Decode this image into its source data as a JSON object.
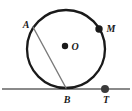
{
  "figure": {
    "type": "geometry-diagram",
    "width": 132,
    "height": 111,
    "background_color": "#ffffff",
    "colors": {
      "circle_stroke": "#1a1a1a",
      "chord_stroke": "#7a7a7a",
      "tangent_stroke": "#8a8a8a",
      "dot_fill": "#1a1a1a",
      "label_color": "#1a1a1a"
    },
    "circle": {
      "center_x": 66,
      "center_y": 49,
      "radius": 39,
      "stroke_width": 2.2
    },
    "tangent_line": {
      "y": 89,
      "x_start": 2,
      "x_end": 130,
      "stroke_width": 2.2
    },
    "chord": {
      "x1": 33,
      "y1": 27,
      "x2": 66,
      "y2": 88,
      "stroke_width": 1.3
    },
    "points": [
      {
        "id": "A",
        "label": "A",
        "x": 33,
        "y": 27,
        "has_dot": false,
        "on": "circle"
      },
      {
        "id": "M",
        "label": "M",
        "x": 99,
        "y": 29,
        "has_dot": true,
        "dot_radius": 3.6,
        "on": "circle"
      },
      {
        "id": "O",
        "label": "O",
        "x": 65,
        "y": 46,
        "has_dot": true,
        "dot_radius": 3.2,
        "on": "center"
      },
      {
        "id": "B",
        "label": "B",
        "x": 66,
        "y": 88,
        "has_dot": false,
        "on": "tangent-point"
      },
      {
        "id": "T",
        "label": "T",
        "x": 105,
        "y": 89,
        "has_dot": true,
        "dot_radius": 4.0,
        "on": "tangent-line"
      }
    ]
  }
}
